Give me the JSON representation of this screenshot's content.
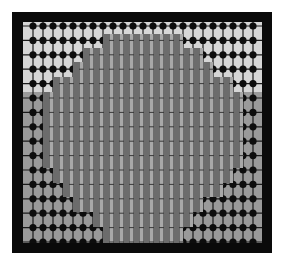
{
  "image": {
    "description": "Grayscale grid of dotted lines with a block of vertical gray bars overlaid",
    "colors": {
      "frame": "#0a0a0a",
      "background_top": "#d6d6d6",
      "background_bottom": "#9a9a9a",
      "grid_line": "#1a1a1a",
      "grid_dot": "#0d0d0d",
      "bar": "#6c6c6c",
      "bar_gap": "#a8a8a8"
    },
    "split_y": 70,
    "grid": {
      "col_spacing": 10,
      "col_offset": 10,
      "row_spacing": 14.4,
      "row_offset": 4,
      "cols": 23,
      "rows": 16
    },
    "bar_columns": [
      {
        "x": 25,
        "top": 70,
        "bottom": 146
      },
      {
        "x": 35,
        "top": 55,
        "bottom": 161
      },
      {
        "x": 45,
        "top": 55,
        "bottom": 175
      },
      {
        "x": 55,
        "top": 40,
        "bottom": 190
      },
      {
        "x": 65,
        "top": 26,
        "bottom": 190
      },
      {
        "x": 75,
        "top": 26,
        "bottom": 205
      },
      {
        "x": 85,
        "top": 12,
        "bottom": 221
      },
      {
        "x": 95,
        "top": 12,
        "bottom": 221
      },
      {
        "x": 105,
        "top": 12,
        "bottom": 221
      },
      {
        "x": 115,
        "top": 12,
        "bottom": 221
      },
      {
        "x": 125,
        "top": 12,
        "bottom": 221
      },
      {
        "x": 135,
        "top": 12,
        "bottom": 221
      },
      {
        "x": 145,
        "top": 12,
        "bottom": 221
      },
      {
        "x": 155,
        "top": 12,
        "bottom": 221
      },
      {
        "x": 165,
        "top": 26,
        "bottom": 205
      },
      {
        "x": 175,
        "top": 26,
        "bottom": 190
      },
      {
        "x": 185,
        "top": 40,
        "bottom": 175
      },
      {
        "x": 195,
        "top": 55,
        "bottom": 175
      },
      {
        "x": 205,
        "top": 55,
        "bottom": 161
      },
      {
        "x": 215,
        "top": 70,
        "bottom": 146
      }
    ],
    "bar_width": 7
  }
}
